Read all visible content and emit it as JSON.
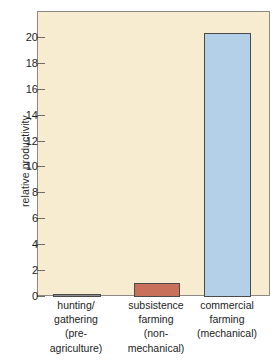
{
  "chart_data": {
    "type": "bar",
    "title": "",
    "xlabel": "",
    "ylabel": "relative productivity",
    "categories": [
      "hunting/ gathering (pre- agriculture)",
      "subsistence farming (non- mechanical)",
      "commercial farming (mechanical)"
    ],
    "category_lines": [
      [
        "hunting/",
        "gathering",
        "(pre-",
        "agriculture)"
      ],
      [
        "subsistence",
        "farming",
        "(non-",
        "mechanical)"
      ],
      [
        "commercial",
        "farming",
        "(mechanical)"
      ]
    ],
    "values": [
      0.2,
      1.05,
      20.4
    ],
    "bar_colors": [
      "#8e8e8e",
      "#c9705a",
      "#b3d0e8"
    ],
    "bar_edge_color": "#4a4a4a",
    "ylim": [
      0,
      22
    ],
    "yticks": [
      0,
      2,
      4,
      6,
      8,
      10,
      12,
      14,
      16,
      18,
      20
    ],
    "ytick_labels": [
      "0",
      "2",
      "4",
      "6",
      "8",
      "10",
      "12",
      "14",
      "16",
      "18",
      "20"
    ],
    "grid": false,
    "legend": null,
    "plot_background": "#f8ecd0",
    "frame_color": "#8d8a84",
    "figure_background": "#ffffff"
  }
}
